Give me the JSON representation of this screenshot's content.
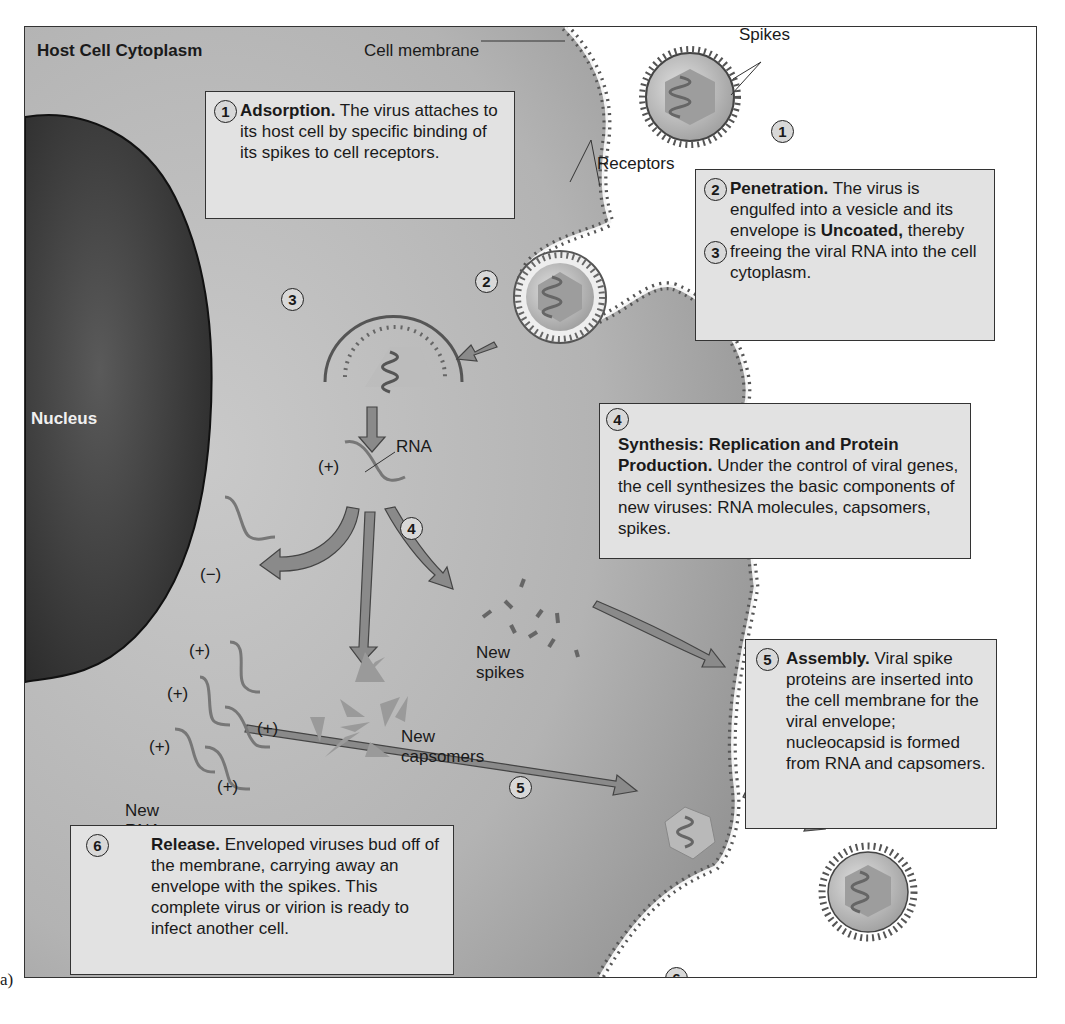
{
  "figure": {
    "panel_label": "a)",
    "title_region": "Host Cell Cytoplasm",
    "labels": {
      "cell_membrane": "Cell membrane",
      "spikes": "Spikes",
      "receptors": "Receptors",
      "nucleus": "Nucleus",
      "rna": "RNA",
      "plus": "(+)",
      "minus": "(−)",
      "new_spikes": "New spikes",
      "new_capsomers": "New capsomers",
      "new_rna": "New RNA"
    },
    "markers": [
      "1",
      "2",
      "3",
      "4",
      "5",
      "6"
    ],
    "steps": [
      {
        "num": "1",
        "title": "Adsorption.",
        "text": "The virus attaches to its host cell by specific binding of its spikes to cell receptors."
      },
      {
        "num": "2",
        "title": "Penetration.",
        "text": "The virus is engulfed into a vesicle and its envelope is"
      },
      {
        "num": "3",
        "title": "Uncoated,",
        "text": "thereby freeing the viral RNA into the cell cytoplasm."
      },
      {
        "num": "4",
        "title": "Synthesis: Replication and Protein Production.",
        "text": "Under the control of viral genes, the cell synthesizes the basic components of new viruses: RNA molecules, capsomers, spikes."
      },
      {
        "num": "5",
        "title": "Assembly.",
        "text": "Viral spike proteins are inserted into the cell membrane for the viral envelope; nucleocapsid is formed from RNA and capsomers."
      },
      {
        "num": "6",
        "title": "Release.",
        "text": "Enveloped viruses bud off of the membrane, carrying away an envelope with the spikes. This complete virus or virion is ready to infect another cell."
      }
    ],
    "colors": {
      "cytoplasm": "#a9a9a9",
      "nucleus": "#3c3c3c",
      "box_fill": "#e2e2e2",
      "arrow": "#8a8a8a",
      "outline": "#333333"
    }
  }
}
